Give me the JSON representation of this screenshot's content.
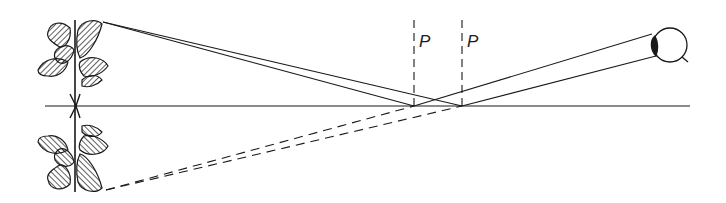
{
  "diagram": {
    "type": "optics-reflection",
    "labels": {
      "normal_left": "P",
      "normal_right": "P"
    },
    "elements": {
      "object": "plant",
      "image": "reflected-plant",
      "observer": "eye",
      "mirror_line": "horizontal-reflecting-surface"
    },
    "colors": {
      "ink": "#1a1a1a",
      "background": "#ffffff"
    }
  }
}
